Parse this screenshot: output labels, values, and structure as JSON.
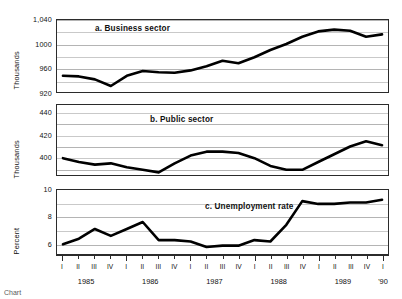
{
  "figure": {
    "caption": "Chart"
  },
  "chart_data": [
    {
      "type": "line",
      "title": "a.  Business sector",
      "ylabel": "Thousands",
      "xlabel": "",
      "ylim": [
        920,
        1040
      ],
      "yticks": [
        920,
        960,
        1000,
        1040
      ],
      "ytick_labels": [
        "920",
        "960",
        "1000",
        "1,040"
      ],
      "grid": true,
      "x": [
        "1985 I",
        "1985 II",
        "1985 III",
        "1985 IV",
        "1986 I",
        "1986 II",
        "1986 III",
        "1986 IV",
        "1987 I",
        "1987 II",
        "1987 III",
        "1987 IV",
        "1988 I",
        "1988 II",
        "1988 III",
        "1988 IV",
        "1989 I",
        "1989 II",
        "1989 III",
        "1989 IV",
        "1990 I"
      ],
      "values": [
        947,
        946,
        941,
        930,
        947,
        955,
        953,
        952,
        956,
        963,
        972,
        968,
        978,
        990,
        1000,
        1012,
        1021,
        1024,
        1022,
        1012,
        1016
      ]
    },
    {
      "type": "line",
      "title": "b.  Public sector",
      "ylabel": "Thousands",
      "xlabel": "",
      "ylim": [
        394,
        448
      ],
      "yticks": [
        400,
        420,
        440
      ],
      "ytick_labels": [
        "400",
        "420",
        "440"
      ],
      "grid": true,
      "x": [
        "1985 I",
        "1985 II",
        "1985 III",
        "1985 IV",
        "1986 I",
        "1986 II",
        "1986 III",
        "1986 IV",
        "1987 I",
        "1987 II",
        "1987 III",
        "1987 IV",
        "1988 I",
        "1988 II",
        "1988 III",
        "1988 IV",
        "1989 I",
        "1989 II",
        "1989 III",
        "1989 IV",
        "1990 I"
      ],
      "values": [
        407,
        404,
        402,
        403,
        400,
        398,
        396,
        403,
        409,
        412,
        412,
        411,
        407,
        401,
        398,
        398,
        404,
        410,
        416,
        420,
        417
      ]
    },
    {
      "type": "line",
      "title": "c.  Unemployment rate",
      "ylabel": "Percent",
      "xlabel": "",
      "ylim": [
        5.4,
        10
      ],
      "yticks": [
        6,
        7,
        8,
        9,
        10
      ],
      "ytick_labels": [
        "6",
        "",
        "8",
        "",
        "10"
      ],
      "grid": true,
      "x": [
        "1985 I",
        "1985 II",
        "1985 III",
        "1985 IV",
        "1986 I",
        "1986 II",
        "1986 III",
        "1986 IV",
        "1987 I",
        "1987 II",
        "1987 III",
        "1987 IV",
        "1988 I",
        "1988 II",
        "1988 III",
        "1988 IV",
        "1989 I",
        "1989 II",
        "1989 III",
        "1989 IV",
        "1990 I"
      ],
      "values": [
        6.1,
        6.5,
        7.2,
        6.7,
        7.2,
        7.7,
        6.4,
        6.4,
        6.3,
        5.9,
        6.0,
        6.0,
        6.4,
        6.3,
        7.5,
        9.2,
        9.0,
        9.0,
        9.1,
        9.1,
        9.3
      ]
    }
  ],
  "xaxis": {
    "quarter_labels": [
      "I",
      "II",
      "III",
      "IV",
      "I",
      "II",
      "III",
      "IV",
      "I",
      "II",
      "III",
      "IV",
      "I",
      "II",
      "III",
      "IV",
      "I",
      "II",
      "III",
      "IV",
      "I"
    ],
    "year_labels": [
      "1985",
      "1986",
      "1987",
      "1988",
      "1989",
      "'90"
    ]
  }
}
